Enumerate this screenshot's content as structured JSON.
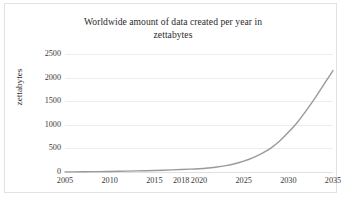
{
  "chart_data": {
    "type": "line",
    "title": "Worldwide amount of data created per year in zettabytes",
    "title_line1": "Worldwide amount of data created per year in",
    "title_line2": "zettabytes",
    "xlabel": "",
    "ylabel": "zettabytes",
    "xlim": [
      2005,
      2035
    ],
    "ylim": [
      0,
      2500
    ],
    "grid": true,
    "legend": false,
    "line_color": "#9a9a9a",
    "grid_color": "#ededed",
    "xtick_labels": [
      "2005",
      "2010",
      "2015",
      "2018",
      "2020",
      "2025",
      "2030",
      "2035"
    ],
    "xticks": [
      2005,
      2010,
      2015,
      2018,
      2020,
      2025,
      2030,
      2035
    ],
    "ytick_labels": [
      "0",
      "500",
      "1000",
      "1500",
      "2000",
      "2500"
    ],
    "yticks": [
      0,
      500,
      1000,
      1500,
      2000,
      2500
    ],
    "x": [
      2005,
      2006,
      2007,
      2008,
      2009,
      2010,
      2011,
      2012,
      2013,
      2014,
      2015,
      2016,
      2017,
      2018,
      2019,
      2020,
      2021,
      2022,
      2023,
      2024,
      2025,
      2026,
      2027,
      2028,
      2029,
      2030,
      2031,
      2032,
      2033,
      2034,
      2035
    ],
    "values": [
      2,
      3,
      5,
      7,
      9,
      12,
      15,
      19,
      23,
      27,
      32,
      38,
      45,
      52,
      60,
      70,
      85,
      105,
      135,
      175,
      230,
      300,
      390,
      500,
      650,
      840,
      1050,
      1300,
      1570,
      1860,
      2150
    ],
    "series": [
      {
        "name": "Data created per year",
        "values": [
          2,
          3,
          5,
          7,
          9,
          12,
          15,
          19,
          23,
          27,
          32,
          38,
          45,
          52,
          60,
          70,
          85,
          105,
          135,
          175,
          230,
          300,
          390,
          500,
          650,
          840,
          1050,
          1300,
          1570,
          1860,
          2150
        ]
      }
    ]
  }
}
